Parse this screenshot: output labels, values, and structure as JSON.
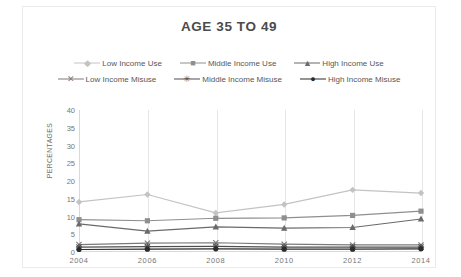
{
  "chart_data": {
    "type": "line",
    "title": "AGE 35 TO 49",
    "xlabel": "",
    "ylabel": "PERCENTAGES",
    "categories": [
      "2004",
      "2006",
      "2008",
      "2010",
      "2012",
      "2014"
    ],
    "x": [
      2004,
      2006,
      2008,
      2010,
      2012,
      2014
    ],
    "ylim": [
      0,
      40
    ],
    "yticks": [
      "0",
      "5",
      "10",
      "15",
      "20",
      "25",
      "30",
      "35",
      "40"
    ],
    "ytick_values": [
      0,
      5,
      10,
      15,
      20,
      25,
      30,
      35,
      40
    ],
    "grid": "vertical",
    "legend_position": "top",
    "series": [
      {
        "name": "Low Income Use",
        "values": [
          14.1,
          16.2,
          11.0,
          13.4,
          17.5,
          16.6
        ],
        "color": "#c3c3c3",
        "marker": "diamond"
      },
      {
        "name": "Middle Income Use",
        "values": [
          9.1,
          8.8,
          9.5,
          9.6,
          10.3,
          11.5
        ],
        "color": "#8f8f8f",
        "marker": "square"
      },
      {
        "name": "High Income Use",
        "values": [
          7.9,
          5.9,
          7.1,
          6.7,
          6.9,
          9.3
        ],
        "color": "#6a6a6a",
        "marker": "triangle"
      },
      {
        "name": "Low Income Misuse",
        "values": [
          2.1,
          2.5,
          2.6,
          2.2,
          2.0,
          2.0
        ],
        "color": "#7a7a7a",
        "marker": "x"
      },
      {
        "name": "Middle Income Misuse",
        "values": [
          1.4,
          1.5,
          1.6,
          1.4,
          1.4,
          1.4
        ],
        "color": "#4e4e4e",
        "marker": "asterisk"
      },
      {
        "name": "High Income Misuse",
        "values": [
          0.7,
          0.8,
          0.9,
          0.8,
          0.8,
          0.9
        ],
        "color": "#2b2b2b",
        "marker": "circle"
      }
    ]
  },
  "legend": {
    "rows": [
      [
        "Low Income Use",
        "Middle Income Use",
        "High Income Use"
      ],
      [
        "Low Income Misuse",
        "Middle Income Misuse",
        "High Income Misuse"
      ]
    ]
  }
}
